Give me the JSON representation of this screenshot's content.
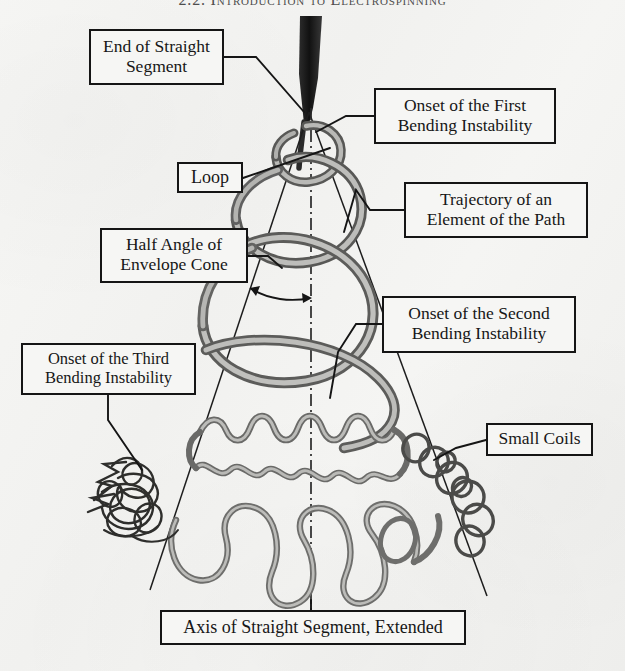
{
  "page": {
    "running_header": "2.2. Introduction to Electrospinning",
    "background_color": "#f4f4f2",
    "ink_color": "#151515",
    "jet_tube_color": "#8a8a88"
  },
  "figure": {
    "name": "electrospinning-jet-bending-instability-diagram",
    "axis_style": "dash-dot vertical centerline",
    "envelope_cone": "straight lines diverging from jet apex",
    "callouts": [
      {
        "id": "end-straight",
        "label": "End of Straight\nSegment"
      },
      {
        "id": "first-bend",
        "label": "Onset of the First\nBending Instability"
      },
      {
        "id": "loop",
        "label": "Loop"
      },
      {
        "id": "trajectory",
        "label": "Trajectory of an\nElement of the Path"
      },
      {
        "id": "half-angle",
        "label": "Half Angle of\nEnvelope Cone"
      },
      {
        "id": "second-bend",
        "label": "Onset of the Second\nBending Instability"
      },
      {
        "id": "third-bend",
        "label": "Onset of the Third\nBending Instability"
      },
      {
        "id": "small-coils",
        "label": "Small Coils"
      },
      {
        "id": "axis-extended",
        "label": "Axis of Straight Segment, Extended"
      }
    ]
  }
}
